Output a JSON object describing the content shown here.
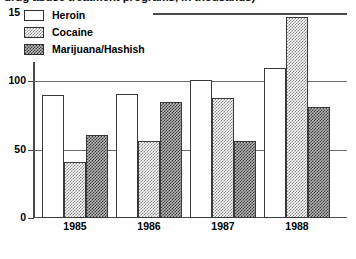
{
  "chart_data": {
    "type": "bar",
    "title": "drug abuse treatment programs, in thousands)",
    "xlabel": "",
    "ylabel": "",
    "categories": [
      "1985",
      "1986",
      "1987",
      "1988"
    ],
    "series": [
      {
        "name": "Heroin",
        "values": [
          90,
          91,
          101,
          110
        ]
      },
      {
        "name": "Cocaine",
        "values": [
          41,
          56,
          88,
          147
        ]
      },
      {
        "name": "Marijuana/Hashish",
        "values": [
          61,
          85,
          56,
          81
        ]
      }
    ],
    "ylim": [
      0,
      150
    ],
    "yticks": [
      0,
      50,
      100,
      150
    ],
    "ytick_labels": [
      "0",
      "50",
      "100",
      "150"
    ],
    "grid": true,
    "legend_position": "top-left",
    "colors": {
      "heroin": "#ffffff",
      "cocaine": "#8a8a8a",
      "marijuana": "#3f3f3f",
      "axis": "#4a4a4a",
      "grid": "#6b6b6b"
    }
  }
}
